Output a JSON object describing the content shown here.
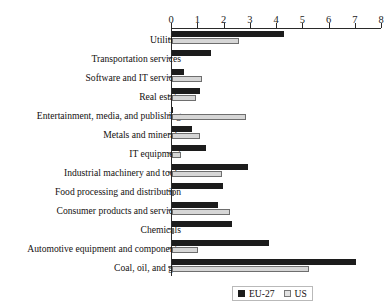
{
  "chart_data": {
    "type": "bar",
    "orientation": "horizontal",
    "title": "",
    "subtitle": "",
    "xlabel": "",
    "ylabel": "",
    "xlim": [
      0,
      8
    ],
    "xticks": [
      "0",
      "1",
      "2",
      "3",
      "4",
      "5",
      "6",
      "7",
      "8"
    ],
    "grid": false,
    "legend_position": "bottom-right",
    "categories": [
      "Utilities",
      "Transportation services",
      "Software and IT services",
      "Real estate",
      "Entertainment, media, and publishing",
      "Metals and minerals",
      "IT equipment",
      "Industrial machinery and tools",
      "Food processing and distribution",
      "Consumer products and services",
      "Chemicals",
      "Automotive equipment and components",
      "Coal, oil, and gas"
    ],
    "series": [
      {
        "name": "EU-27",
        "color": "#1c1c1c",
        "values": [
          4.25,
          1.5,
          0.45,
          1.05,
          0.05,
          0.75,
          1.3,
          2.9,
          1.95,
          1.75,
          2.3,
          3.7,
          7.0
        ]
      },
      {
        "name": "US",
        "color": "#d6d6d6",
        "values": [
          2.55,
          0.0,
          1.15,
          0.9,
          2.8,
          1.05,
          0.35,
          1.9,
          0.05,
          2.2,
          0.05,
          1.0,
          5.2
        ]
      }
    ]
  },
  "legend": {
    "items": [
      {
        "label": "EU-27",
        "swatch": "black-square-swatch"
      },
      {
        "label": "US",
        "swatch": "white-square-swatch"
      }
    ]
  }
}
